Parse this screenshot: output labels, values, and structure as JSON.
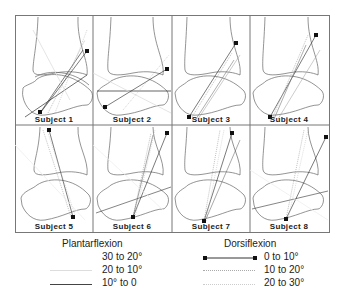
{
  "figure": {
    "panels": [
      {
        "label": "Subject 1"
      },
      {
        "label": "Subject 2"
      },
      {
        "label": "Subject 3"
      },
      {
        "label": "Subject 4"
      },
      {
        "label": "Subject 5"
      },
      {
        "label": "Subject 6"
      },
      {
        "label": "Subject 7"
      },
      {
        "label": "Subject 8"
      }
    ]
  },
  "legend": {
    "plantarflexion": {
      "title": "Plantarflexion",
      "items": [
        {
          "label": "30 to 20°",
          "style": "faint-solid"
        },
        {
          "label": "20 to 10°",
          "style": "light-solid"
        },
        {
          "label": "10° to 0",
          "style": "solid"
        }
      ]
    },
    "dorsiflexion": {
      "title": "Dorsiflexion",
      "items": [
        {
          "label": "0 to 10°",
          "style": "solid-with-square-endpoints"
        },
        {
          "label": "10 to 20°",
          "style": "dotted"
        },
        {
          "label": "20 to 30°",
          "style": "fine-dotted"
        }
      ]
    }
  },
  "colors": {
    "outline": "#555555",
    "line_dark": "#222222",
    "line_light": "#bbbbbb",
    "line_faint": "#dddddd"
  }
}
